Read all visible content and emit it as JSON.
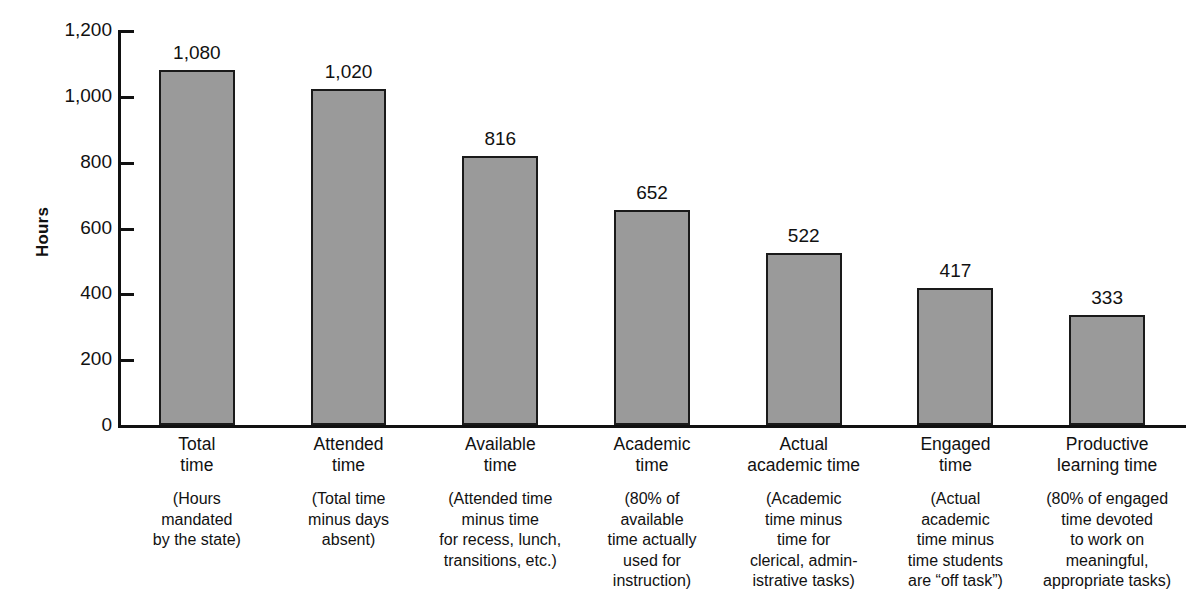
{
  "chart_data": {
    "type": "bar",
    "title": "",
    "xlabel": "",
    "ylabel": "Hours",
    "ylim": [
      0,
      1200
    ],
    "ytick_values": [
      0,
      200,
      400,
      600,
      800,
      1000,
      1200
    ],
    "ytick_labels": [
      "0",
      "200",
      "400",
      "600",
      "800",
      "1,000",
      "1,200"
    ],
    "grid": false,
    "legend": "none",
    "bar_color": "#9a9a9a",
    "bar_edge_color": "#1a1a1a",
    "axis_color": "#111111",
    "categories": [
      "Total\ntime",
      "Attended\ntime",
      "Available\ntime",
      "Academic\ntime",
      "Actual\nacademic time",
      "Engaged\ntime",
      "Productive\nlearning time"
    ],
    "category_descriptions": [
      "(Hours\nmandated\nby the state)",
      "(Total time\nminus days\nabsent)",
      "(Attended time\nminus time\nfor recess, lunch,\ntransitions, etc.)",
      "(80% of\navailable\ntime actually\nused for\ninstruction)",
      "(Academic\ntime minus\ntime for\nclerical, admin-\nistrative tasks)",
      "(Actual\nacademic\ntime minus\ntime students\nare “off task”)",
      "(80% of engaged\ntime devoted\nto work on\nmeaningful,\nappropriate tasks)"
    ],
    "values": [
      1080,
      1020,
      816,
      652,
      522,
      417,
      333
    ],
    "value_labels": [
      "1,080",
      "1,020",
      "816",
      "652",
      "522",
      "417",
      "333"
    ]
  }
}
